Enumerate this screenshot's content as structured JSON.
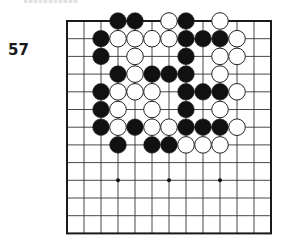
{
  "problem": {
    "number": "57"
  },
  "board": {
    "size": 13,
    "origin_x": 67,
    "origin_y": 21,
    "cell_w": 17,
    "cell_h": 17.7,
    "stone_radius": 8.3,
    "line_color": "#333333",
    "border_width": 2,
    "star_points": [
      [
        9,
        3
      ],
      [
        9,
        6
      ],
      [
        9,
        9
      ]
    ],
    "stones": [
      {
        "r": 0,
        "c": 3,
        "color": "black"
      },
      {
        "r": 0,
        "c": 4,
        "color": "black"
      },
      {
        "r": 0,
        "c": 6,
        "color": "white"
      },
      {
        "r": 0,
        "c": 7,
        "color": "black"
      },
      {
        "r": 0,
        "c": 9,
        "color": "white"
      },
      {
        "r": 1,
        "c": 2,
        "color": "black"
      },
      {
        "r": 1,
        "c": 3,
        "color": "white"
      },
      {
        "r": 1,
        "c": 4,
        "color": "white"
      },
      {
        "r": 1,
        "c": 5,
        "color": "white"
      },
      {
        "r": 1,
        "c": 6,
        "color": "white"
      },
      {
        "r": 1,
        "c": 7,
        "color": "black"
      },
      {
        "r": 1,
        "c": 8,
        "color": "black"
      },
      {
        "r": 1,
        "c": 9,
        "color": "black"
      },
      {
        "r": 1,
        "c": 10,
        "color": "white"
      },
      {
        "r": 2,
        "c": 2,
        "color": "black"
      },
      {
        "r": 2,
        "c": 4,
        "color": "white"
      },
      {
        "r": 2,
        "c": 7,
        "color": "black"
      },
      {
        "r": 2,
        "c": 9,
        "color": "white"
      },
      {
        "r": 2,
        "c": 10,
        "color": "white"
      },
      {
        "r": 3,
        "c": 3,
        "color": "black"
      },
      {
        "r": 3,
        "c": 4,
        "color": "white"
      },
      {
        "r": 3,
        "c": 5,
        "color": "black"
      },
      {
        "r": 3,
        "c": 6,
        "color": "black"
      },
      {
        "r": 3,
        "c": 7,
        "color": "black"
      },
      {
        "r": 3,
        "c": 9,
        "color": "white"
      },
      {
        "r": 4,
        "c": 2,
        "color": "black"
      },
      {
        "r": 4,
        "c": 3,
        "color": "white"
      },
      {
        "r": 4,
        "c": 4,
        "color": "white"
      },
      {
        "r": 4,
        "c": 5,
        "color": "white"
      },
      {
        "r": 4,
        "c": 7,
        "color": "black"
      },
      {
        "r": 4,
        "c": 8,
        "color": "black"
      },
      {
        "r": 4,
        "c": 9,
        "color": "black"
      },
      {
        "r": 4,
        "c": 10,
        "color": "white"
      },
      {
        "r": 5,
        "c": 2,
        "color": "black"
      },
      {
        "r": 5,
        "c": 3,
        "color": "white"
      },
      {
        "r": 5,
        "c": 5,
        "color": "white"
      },
      {
        "r": 5,
        "c": 7,
        "color": "black"
      },
      {
        "r": 5,
        "c": 9,
        "color": "white"
      },
      {
        "r": 6,
        "c": 2,
        "color": "black"
      },
      {
        "r": 6,
        "c": 3,
        "color": "white"
      },
      {
        "r": 6,
        "c": 4,
        "color": "black"
      },
      {
        "r": 6,
        "c": 5,
        "color": "white"
      },
      {
        "r": 6,
        "c": 6,
        "color": "white"
      },
      {
        "r": 6,
        "c": 7,
        "color": "black"
      },
      {
        "r": 6,
        "c": 8,
        "color": "black"
      },
      {
        "r": 6,
        "c": 9,
        "color": "black"
      },
      {
        "r": 6,
        "c": 10,
        "color": "white"
      },
      {
        "r": 7,
        "c": 3,
        "color": "black"
      },
      {
        "r": 7,
        "c": 5,
        "color": "black"
      },
      {
        "r": 7,
        "c": 6,
        "color": "black"
      },
      {
        "r": 7,
        "c": 7,
        "color": "white"
      },
      {
        "r": 7,
        "c": 8,
        "color": "white"
      },
      {
        "r": 7,
        "c": 9,
        "color": "white"
      }
    ]
  }
}
